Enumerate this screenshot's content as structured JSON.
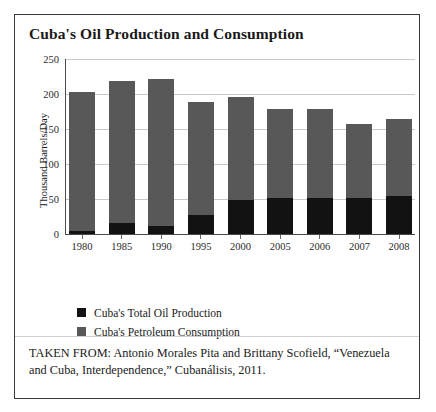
{
  "figure": {
    "title": "Cuba's Oil Production and Consumption",
    "caption": "TAKEN FROM: Antonio Morales Pita and Brittany Scofield, “Venezuela and Cuba, Interdependence,” Cubanálisis, 2011."
  },
  "colors": {
    "production": "#121212",
    "consumption": "#585858",
    "gridline": "#c9c9c9",
    "axis": "#4a4a4a",
    "frame": "#3a3a3a",
    "text": "#1a1a1a"
  },
  "legend": {
    "position": "below-plot-left",
    "items": [
      {
        "label": "Cuba's Total Oil Production",
        "color": "#121212"
      },
      {
        "label": "Cuba's Petroleum Consumption",
        "color": "#585858"
      }
    ]
  },
  "chart_data": {
    "type": "bar",
    "stacked": true,
    "title": "Cuba's Oil Production and Consumption",
    "xlabel": "",
    "ylabel": "Thousand Barrels/Day",
    "ylim": [
      0,
      250
    ],
    "yticks": [
      0,
      50,
      100,
      150,
      200,
      250
    ],
    "ytick_labels": [
      "0",
      "50",
      "100",
      "150",
      "200",
      "250"
    ],
    "grid": true,
    "categories": [
      "1980",
      "1985",
      "1990",
      "1995",
      "2000",
      "2005",
      "2006",
      "2007",
      "2008"
    ],
    "series": [
      {
        "name": "Cuba's Total Oil Production",
        "color": "#121212",
        "values": [
          4,
          16,
          11,
          27,
          48,
          51,
          51,
          51,
          54
        ]
      },
      {
        "name": "Cuba's Petroleum Consumption",
        "color": "#585858",
        "values": [
          203,
          218,
          221,
          189,
          196,
          178,
          178,
          157,
          164
        ]
      }
    ]
  }
}
